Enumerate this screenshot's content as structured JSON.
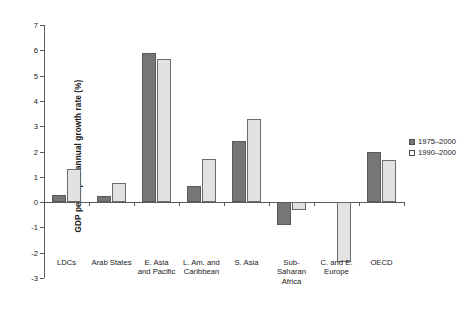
{
  "chart_data": {
    "type": "bar",
    "title": "",
    "xlabel": "",
    "ylabel": "GDP per capita annual growth rate (%)",
    "ylim": [
      -3,
      7
    ],
    "ytick_step": 1,
    "yticks": [
      7,
      6,
      5,
      4,
      3,
      2,
      1,
      0,
      -1,
      -2,
      -3
    ],
    "ytick_labels": [
      "7",
      "6",
      "5",
      "4",
      "3",
      "2",
      "1",
      "0",
      "-1",
      "-2",
      "-3"
    ],
    "grid": false,
    "legend_position": "right",
    "categories": [
      "LDCs",
      "Arab States",
      "E. Asia\nand Pacific",
      "L. Am. and\nCaribbean",
      "S. Asia",
      "Sub-\nSaharan\nAfrica",
      "C. and E.\nEurope",
      "OECD"
    ],
    "series": [
      {
        "name": "1975–2000",
        "color": "#767676",
        "values": [
          0.3,
          0.25,
          5.9,
          0.65,
          2.4,
          -0.9,
          null,
          2.0
        ]
      },
      {
        "name": "1990–2000",
        "color": "#e2e2e2",
        "values": [
          1.3,
          0.75,
          5.65,
          1.7,
          3.3,
          -0.3,
          -2.35,
          1.65
        ]
      }
    ]
  },
  "legend": {
    "entries": [
      {
        "label": "1975–2000",
        "swatch": "filled-dark-square"
      },
      {
        "label": "1990–2000",
        "swatch": "open-square"
      }
    ]
  },
  "axis": {
    "y_title": "GDP per capita annual growth rate (%)"
  }
}
